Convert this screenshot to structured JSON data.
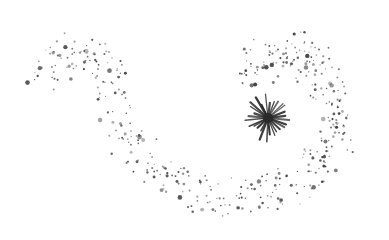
{
  "illustration": {
    "description": "Sparkle swirl: a spiral trail of scattered dots ending at a starburst",
    "background": "#ffffff",
    "ink_color": "#333333",
    "starburst": {
      "cx": 268,
      "cy": 118,
      "rays": 28,
      "inner": 3,
      "outer": 22,
      "color": "#2a2a2a"
    },
    "trail": {
      "seed": 7,
      "count": 430,
      "path_points": [
        [
          42,
          78
        ],
        [
          60,
          60
        ],
        [
          85,
          48
        ],
        [
          105,
          65
        ],
        [
          115,
          100
        ],
        [
          130,
          140
        ],
        [
          160,
          175
        ],
        [
          200,
          195
        ],
        [
          240,
          200
        ],
        [
          280,
          190
        ],
        [
          315,
          168
        ],
        [
          335,
          130
        ],
        [
          330,
          90
        ],
        [
          310,
          60
        ],
        [
          285,
          48
        ],
        [
          262,
          62
        ],
        [
          255,
          90
        ]
      ]
    }
  }
}
